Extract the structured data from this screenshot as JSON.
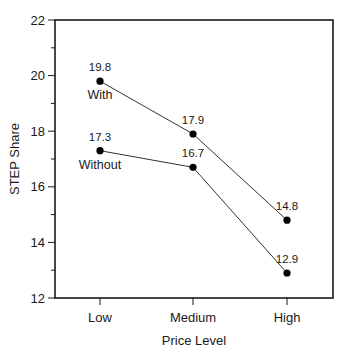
{
  "chart_data": {
    "type": "line",
    "title": "",
    "xlabel": "Price Level",
    "ylabel": "STEP Share",
    "categories": [
      "Low",
      "Medium",
      "High"
    ],
    "ylim": [
      12,
      22
    ],
    "yticks": [
      12,
      14,
      16,
      18,
      20,
      22
    ],
    "grid": false,
    "legend": "inline labels",
    "series": [
      {
        "name": "With",
        "values": [
          19.8,
          17.9,
          14.8
        ],
        "labels": [
          "19.8",
          "17.9",
          "14.8"
        ]
      },
      {
        "name": "Without",
        "values": [
          17.3,
          16.7,
          12.9
        ],
        "labels": [
          "17.3",
          "16.7",
          "12.9"
        ]
      }
    ]
  },
  "colors": {
    "line": "#333333",
    "marker": "#000000",
    "axis": "#1a1a1a"
  }
}
